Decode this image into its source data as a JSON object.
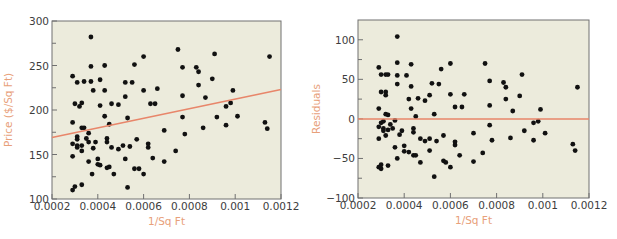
{
  "colors": {
    "plot_bg": "#ecebdc",
    "axis": "#707070",
    "tick_label": "#3d3d3d",
    "axis_title": "#e8a07a",
    "fit_line": "#e8866a",
    "point": "#111111"
  },
  "chart_data": [
    {
      "type": "scatter",
      "title": "",
      "xlabel": "1/Sq Ft",
      "ylabel": "Price ($/Sq Ft)",
      "xlim": [
        0.0002,
        0.0012
      ],
      "ylim": [
        100,
        300
      ],
      "xticks": [
        "0.0002",
        "0.0004",
        "0.0006",
        "0.0008",
        "0.001",
        "0.0012"
      ],
      "yticks": [
        "100",
        "150",
        "200",
        "250",
        "300"
      ],
      "xtick_values": [
        0.0002,
        0.0004,
        0.0006,
        0.0008,
        0.001,
        0.0012
      ],
      "ytick_values": [
        100,
        150,
        200,
        250,
        300
      ],
      "grid": false,
      "fit_line": {
        "x": [
          0.0002,
          0.0012
        ],
        "y": [
          169,
          223
        ]
      },
      "points": [
        [
          0.00029,
          110
        ],
        [
          0.0003,
          114
        ],
        [
          0.00033,
          116
        ],
        [
          0.000375,
          128
        ],
        [
          0.0004,
          139
        ],
        [
          0.00041,
          138
        ],
        [
          0.00044,
          135
        ],
        [
          0.00045,
          136
        ],
        [
          0.00047,
          128
        ],
        [
          0.00053,
          113
        ],
        [
          0.00056,
          134
        ],
        [
          0.00058,
          134
        ],
        [
          0.0006,
          128
        ],
        [
          0.00029,
          148
        ],
        [
          0.00029,
          162
        ],
        [
          0.00031,
          158
        ],
        [
          0.00031,
          160
        ],
        [
          0.00033,
          154
        ],
        [
          0.00033,
          160
        ],
        [
          0.00036,
          142
        ],
        [
          0.00038,
          157
        ],
        [
          0.0004,
          145
        ],
        [
          0.00044,
          168
        ],
        [
          0.00046,
          158
        ],
        [
          0.00049,
          156
        ],
        [
          0.00051,
          160
        ],
        [
          0.00052,
          145
        ],
        [
          0.00054,
          159
        ],
        [
          0.00057,
          167
        ],
        [
          0.00062,
          158
        ],
        [
          0.00062,
          162
        ],
        [
          0.00064,
          146
        ],
        [
          0.00069,
          142
        ],
        [
          0.00074,
          154
        ],
        [
          0.00029,
          186
        ],
        [
          0.00031,
          170
        ],
        [
          0.00031,
          167
        ],
        [
          0.00033,
          180
        ],
        [
          0.00034,
          180
        ],
        [
          0.00035,
          168
        ],
        [
          0.00036,
          164
        ],
        [
          0.00036,
          174
        ],
        [
          0.00039,
          164
        ],
        [
          0.00043,
          193
        ],
        [
          0.00044,
          164
        ],
        [
          0.00045,
          184
        ],
        [
          0.00053,
          191
        ],
        [
          0.00069,
          177
        ],
        [
          0.00077,
          192
        ],
        [
          0.00078,
          173
        ],
        [
          0.00086,
          180
        ],
        [
          0.00096,
          183
        ],
        [
          0.00092,
          192
        ],
        [
          0.00101,
          193
        ],
        [
          0.00113,
          186
        ],
        [
          0.00114,
          179
        ],
        [
          0.0003,
          207
        ],
        [
          0.00032,
          204
        ],
        [
          0.00033,
          208
        ],
        [
          0.00038,
          222
        ],
        [
          0.00041,
          205
        ],
        [
          0.00043,
          222
        ],
        [
          0.00046,
          207
        ],
        [
          0.00049,
          206
        ],
        [
          0.00052,
          215
        ],
        [
          0.0006,
          222
        ],
        [
          0.00063,
          207
        ],
        [
          0.00065,
          207
        ],
        [
          0.00066,
          224
        ],
        [
          0.00077,
          216
        ],
        [
          0.00084,
          228
        ],
        [
          0.00087,
          214
        ],
        [
          0.00096,
          204
        ],
        [
          0.00098,
          208
        ],
        [
          0.00099,
          222
        ],
        [
          0.00029,
          238
        ],
        [
          0.00031,
          231
        ],
        [
          0.00034,
          232
        ],
        [
          0.00037,
          249
        ],
        [
          0.00037,
          232
        ],
        [
          0.00041,
          234
        ],
        [
          0.00043,
          250
        ],
        [
          0.00052,
          231
        ],
        [
          0.00055,
          231
        ],
        [
          0.00056,
          251
        ],
        [
          0.0006,
          260
        ],
        [
          0.00075,
          268
        ],
        [
          0.00077,
          248
        ],
        [
          0.00083,
          248
        ],
        [
          0.00084,
          243
        ],
        [
          0.0009,
          235
        ],
        [
          0.00091,
          263
        ],
        [
          0.00115,
          260
        ],
        [
          0.00037,
          282
        ]
      ]
    },
    {
      "type": "scatter",
      "title": "",
      "xlabel": "1/Sq Ft",
      "ylabel": "Residuals",
      "xlim": [
        0.0002,
        0.0012
      ],
      "ylim": [
        -100,
        125
      ],
      "xticks": [
        "0.0002",
        "0.0004",
        "0.0006",
        "0.0008",
        "0.001",
        "0.0012"
      ],
      "yticks": [
        "-100",
        "-50",
        "0",
        "50",
        "100"
      ],
      "xtick_values": [
        0.0002,
        0.0004,
        0.0006,
        0.0008,
        0.001,
        0.0012
      ],
      "ytick_values": [
        -100,
        -50,
        0,
        50,
        100
      ],
      "grid": false,
      "fit_line": {
        "x": [
          0.0002,
          0.0012
        ],
        "y": [
          0,
          0
        ]
      },
      "points": [
        [
          0.00029,
          65
        ],
        [
          0.0003,
          56
        ],
        [
          0.00032,
          56
        ],
        [
          0.00033,
          56
        ],
        [
          0.00037,
          71
        ],
        [
          0.00037,
          55
        ],
        [
          0.00041,
          55
        ],
        [
          0.00043,
          69
        ],
        [
          0.00052,
          45
        ],
        [
          0.00055,
          44
        ],
        [
          0.00056,
          63
        ],
        [
          0.0006,
          70
        ],
        [
          0.00075,
          70
        ],
        [
          0.00077,
          48
        ],
        [
          0.00083,
          46
        ],
        [
          0.00084,
          40
        ],
        [
          0.00091,
          56
        ],
        [
          0.00115,
          40
        ],
        [
          0.00037,
          104
        ],
        [
          0.00029,
          13
        ],
        [
          0.0003,
          34
        ],
        [
          0.00032,
          30
        ],
        [
          0.00032,
          34
        ],
        [
          0.00032,
          6
        ],
        [
          0.00033,
          5
        ],
        [
          0.00037,
          44
        ],
        [
          0.00042,
          25
        ],
        [
          0.00043,
          13
        ],
        [
          0.00043,
          41
        ],
        [
          0.00045,
          3
        ],
        [
          0.00046,
          26
        ],
        [
          0.00049,
          23
        ],
        [
          0.00051,
          30
        ],
        [
          0.00053,
          6
        ],
        [
          0.0006,
          31
        ],
        [
          0.00062,
          15
        ],
        [
          0.00065,
          15
        ],
        [
          0.00066,
          31
        ],
        [
          0.00077,
          17
        ],
        [
          0.00084,
          25
        ],
        [
          0.00087,
          10
        ],
        [
          0.0009,
          29
        ],
        [
          0.00099,
          12
        ],
        [
          0.00029,
          -10
        ],
        [
          0.00029,
          -25
        ],
        [
          0.0003,
          -5
        ],
        [
          0.00031,
          -3
        ],
        [
          0.00031,
          -12
        ],
        [
          0.00031,
          -15
        ],
        [
          0.00032,
          -21
        ],
        [
          0.00033,
          -14
        ],
        [
          0.00034,
          -7
        ],
        [
          0.00035,
          -12
        ],
        [
          0.00036,
          -2
        ],
        [
          0.00038,
          -20
        ],
        [
          0.00039,
          -15
        ],
        [
          0.00044,
          -17
        ],
        [
          0.00044,
          -12
        ],
        [
          0.00047,
          -25
        ],
        [
          0.00049,
          -28
        ],
        [
          0.00051,
          -25
        ],
        [
          0.00054,
          -28
        ],
        [
          0.00057,
          -21
        ],
        [
          0.00062,
          -33
        ],
        [
          0.00062,
          -29
        ],
        [
          0.0007,
          -18
        ],
        [
          0.00077,
          -8
        ],
        [
          0.00078,
          -27
        ],
        [
          0.00086,
          -24
        ],
        [
          0.00092,
          -15
        ],
        [
          0.00096,
          -5
        ],
        [
          0.00096,
          -27
        ],
        [
          0.00098,
          -3
        ],
        [
          0.00101,
          -18
        ],
        [
          0.00113,
          -32
        ],
        [
          0.00114,
          -40
        ],
        [
          0.00029,
          -61
        ],
        [
          0.0003,
          -63
        ],
        [
          0.0003,
          -58
        ],
        [
          0.00033,
          -59
        ],
        [
          0.00036,
          -36
        ],
        [
          0.00037,
          -50
        ],
        [
          0.0004,
          -34
        ],
        [
          0.0004,
          -41
        ],
        [
          0.00042,
          -42
        ],
        [
          0.00044,
          -46
        ],
        [
          0.00045,
          -46
        ],
        [
          0.00047,
          -55
        ],
        [
          0.00051,
          -40
        ],
        [
          0.00053,
          -73
        ],
        [
          0.00057,
          -53
        ],
        [
          0.00058,
          -55
        ],
        [
          0.0006,
          -61
        ],
        [
          0.00064,
          -46
        ],
        [
          0.0007,
          -54
        ],
        [
          0.00074,
          -43
        ]
      ]
    }
  ]
}
